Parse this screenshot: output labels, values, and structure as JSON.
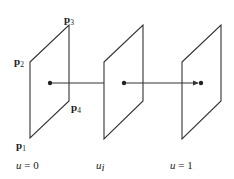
{
  "diagram": {
    "stroke_color": "#333333",
    "points": [
      {
        "name": "p",
        "sub": "1",
        "label": "p1"
      },
      {
        "name": "p",
        "sub": "2",
        "label": "p2"
      },
      {
        "name": "p",
        "sub": "3",
        "label": "p3"
      },
      {
        "name": "p",
        "sub": "4",
        "label": "p4"
      }
    ],
    "planes": [
      {
        "id": "plane-u0",
        "label_var": "u",
        "label_rest": " = 0"
      },
      {
        "id": "plane-ui",
        "label_var": "u",
        "label_sub": "i"
      },
      {
        "id": "plane-u1",
        "label_var": "u",
        "label_rest": " = 1"
      }
    ]
  }
}
